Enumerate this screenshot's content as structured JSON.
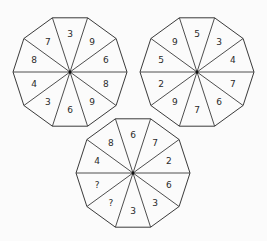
{
  "puzzle": {
    "title_partial": "",
    "decagons": [
      {
        "id": "top-left",
        "center": [
          70,
          72
        ],
        "radius": 57,
        "numbers_clockwise_from_top": [
          "3",
          "9",
          "6",
          "8",
          "9",
          "6",
          "3",
          "4",
          "8",
          "7"
        ]
      },
      {
        "id": "top-right",
        "center": [
          197,
          72
        ],
        "radius": 57,
        "numbers_clockwise_from_top": [
          "5",
          "3",
          "4",
          "7",
          "6",
          "7",
          "9",
          "2",
          "5",
          "9"
        ]
      },
      {
        "id": "bottom",
        "center": [
          133,
          173
        ],
        "radius": 57,
        "numbers_clockwise_from_top": [
          "6",
          "7",
          "2",
          "6",
          "3",
          "3",
          "?",
          "?",
          "4",
          "8"
        ]
      }
    ],
    "colors": {
      "stroke": "#3a3a3a",
      "text": "#2a2a2a",
      "background": "#fbfbfb"
    }
  }
}
